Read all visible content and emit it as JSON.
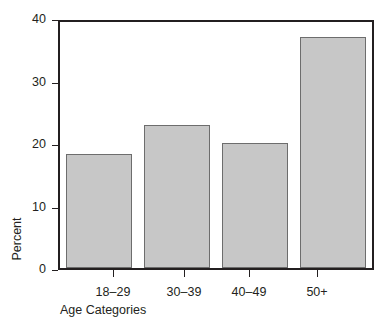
{
  "chart_data": {
    "type": "bar",
    "title": "",
    "categories": [
      "18–29",
      "30–39",
      "40–49",
      "50+"
    ],
    "values": [
      18.5,
      23.2,
      20.3,
      37.6
    ],
    "xlabel": "Age Categories",
    "ylabel": "Percent",
    "ylim": [
      0,
      40
    ],
    "yticks": [
      0,
      10,
      20,
      30,
      40
    ],
    "ytick_labels": [
      "0",
      "10",
      "20",
      "30",
      "40"
    ],
    "grid": false,
    "legend": false,
    "bar_color": "#c7c7c7",
    "bar_border_color": "#6d6d6d",
    "axis_color": "#231f20",
    "background": "#ffffff"
  }
}
